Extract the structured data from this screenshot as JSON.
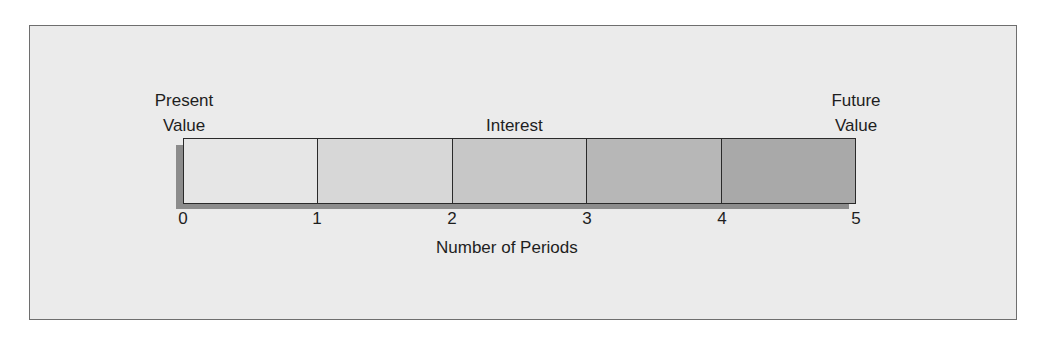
{
  "diagram": {
    "labels": {
      "present_value": [
        "Present",
        "Value"
      ],
      "future_value": [
        "Future",
        "Value"
      ],
      "interest": "Interest",
      "x_axis": "Number of Periods"
    },
    "ticks": [
      "0",
      "1",
      "2",
      "3",
      "4",
      "5"
    ],
    "segments": [
      {
        "period": "0-1",
        "fill": "#e6e6e6"
      },
      {
        "period": "1-2",
        "fill": "#d7d7d7"
      },
      {
        "period": "2-3",
        "fill": "#c7c7c7"
      },
      {
        "period": "3-4",
        "fill": "#b7b7b7"
      },
      {
        "period": "4-5",
        "fill": "#a9a9a9"
      }
    ],
    "colors": {
      "background": "#ebebeb",
      "frame_border": "#6e6e6e",
      "shadow": "#8c8c8c",
      "lines": "#2a2a2a"
    }
  }
}
